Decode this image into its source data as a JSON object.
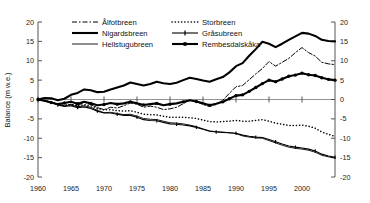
{
  "chart_data": {
    "type": "line",
    "title": "",
    "xlabel": "",
    "ylabel": "Balance (m w.e.)",
    "ylabel_right": "",
    "xlim": [
      1960,
      2005
    ],
    "ylim": [
      -20,
      20
    ],
    "yticks": [
      -20,
      -15,
      -10,
      -5,
      0,
      5,
      10,
      15,
      20
    ],
    "ytick_labels": [
      "-20",
      "-15",
      "-10",
      "-5",
      "0",
      "5",
      "10",
      "15",
      "20"
    ],
    "ytick_labels_right": [
      "-20",
      "-15",
      "-10",
      "-5",
      "0",
      "5",
      "10",
      "15",
      "20"
    ],
    "xticks": [
      1960,
      1965,
      1970,
      1975,
      1980,
      1985,
      1990,
      1995,
      2000
    ],
    "xtick_labels": [
      "1960",
      "1965",
      "1970",
      "1975",
      "1980",
      "1985",
      "1990",
      "1995",
      "2000"
    ],
    "grid": false,
    "legend_position": "top",
    "dual_y_axis": true,
    "x": [
      1960,
      1961,
      1962,
      1963,
      1964,
      1965,
      1966,
      1967,
      1968,
      1969,
      1970,
      1971,
      1972,
      1973,
      1974,
      1975,
      1976,
      1977,
      1978,
      1979,
      1980,
      1981,
      1982,
      1983,
      1984,
      1985,
      1986,
      1987,
      1988,
      1989,
      1990,
      1991,
      1992,
      1993,
      1994,
      1995,
      1996,
      1997,
      1998,
      1999,
      2000,
      2001,
      2002,
      2003,
      2004,
      2005
    ],
    "series": [
      {
        "name": "Ålfotbreen",
        "style": "dashed",
        "values": [
          0.0,
          -0.3,
          -0.7,
          -1.3,
          -1.6,
          -1.2,
          -1.6,
          -0.7,
          -1.3,
          -2.1,
          -2.6,
          -2.0,
          -2.2,
          -1.6,
          -0.9,
          -1.2,
          -2.0,
          -1.7,
          -2.0,
          -2.6,
          -2.4,
          -2.0,
          -1.1,
          -0.2,
          -0.5,
          -1.3,
          -1.8,
          -1.3,
          -0.2,
          1.6,
          3.3,
          3.6,
          5.1,
          6.6,
          8.0,
          9.8,
          8.6,
          9.6,
          10.6,
          12.1,
          13.4,
          12.1,
          11.2,
          9.6,
          9.2,
          9.0
        ]
      },
      {
        "name": "Nigardsbreen",
        "style": "thick-solid",
        "values": [
          0.0,
          0.4,
          0.3,
          -0.2,
          0.2,
          1.2,
          1.7,
          2.6,
          2.4,
          1.9,
          2.0,
          2.6,
          3.1,
          3.6,
          4.4,
          4.0,
          3.6,
          4.0,
          4.6,
          4.2,
          4.0,
          4.3,
          5.0,
          5.6,
          5.3,
          4.9,
          4.6,
          5.2,
          5.8,
          7.0,
          8.6,
          9.4,
          11.3,
          13.0,
          14.9,
          14.4,
          13.5,
          14.4,
          15.4,
          16.3,
          17.2,
          17.0,
          16.4,
          15.4,
          15.1,
          15.0
        ]
      },
      {
        "name": "Hellstugubreen",
        "style": "thin-solid",
        "values": [
          0.0,
          -0.3,
          -0.6,
          -1.2,
          -1.6,
          -1.4,
          -1.9,
          -1.6,
          -2.0,
          -2.8,
          -3.4,
          -3.3,
          -3.6,
          -3.9,
          -3.8,
          -4.3,
          -4.9,
          -5.1,
          -5.2,
          -5.6,
          -6.0,
          -6.1,
          -6.3,
          -6.6,
          -7.0,
          -7.6,
          -8.1,
          -8.3,
          -8.4,
          -8.6,
          -8.8,
          -9.4,
          -9.7,
          -9.9,
          -10.0,
          -10.6,
          -11.2,
          -11.8,
          -12.3,
          -12.6,
          -12.8,
          -13.1,
          -13.6,
          -14.4,
          -14.8,
          -15.1
        ]
      },
      {
        "name": "Storbreen",
        "style": "dotted",
        "values": [
          0.0,
          -0.3,
          -0.7,
          -1.3,
          -1.5,
          -1.3,
          -1.7,
          -1.3,
          -1.6,
          -2.3,
          -2.7,
          -2.6,
          -2.9,
          -3.0,
          -2.9,
          -3.3,
          -3.8,
          -3.9,
          -4.0,
          -4.3,
          -4.6,
          -4.6,
          -4.6,
          -4.7,
          -4.9,
          -5.3,
          -5.7,
          -5.8,
          -5.7,
          -5.6,
          -5.4,
          -5.6,
          -5.6,
          -5.4,
          -5.2,
          -5.6,
          -6.1,
          -6.4,
          -6.7,
          -6.7,
          -6.6,
          -6.9,
          -7.4,
          -8.4,
          -9.0,
          -9.5
        ]
      },
      {
        "name": "Gråsubreen",
        "style": "solid-tick",
        "values": [
          0.0,
          -0.4,
          -0.8,
          -1.4,
          -1.8,
          -1.6,
          -2.1,
          -1.9,
          -2.3,
          -3.0,
          -3.5,
          -3.5,
          -3.8,
          -4.1,
          -4.1,
          -4.6,
          -5.2,
          -5.4,
          -5.5,
          -5.9,
          -6.3,
          -6.4,
          -6.6,
          -6.8,
          -7.2,
          -7.7,
          -8.2,
          -8.4,
          -8.5,
          -8.6,
          -8.7,
          -9.2,
          -9.5,
          -9.7,
          -9.8,
          -10.3,
          -10.9,
          -11.5,
          -12.0,
          -12.3,
          -12.5,
          -12.8,
          -13.3,
          -14.1,
          -14.6,
          -14.9
        ]
      },
      {
        "name": "Rembesdalskåka",
        "style": "thick-marker",
        "values": [
          0.0,
          -0.3,
          -0.8,
          -1.2,
          -0.9,
          -0.6,
          -1.1,
          -0.6,
          -1.0,
          -1.5,
          -1.3,
          -0.9,
          -1.2,
          -1.0,
          -0.6,
          -1.0,
          -1.4,
          -1.2,
          -1.0,
          -1.5,
          -1.2,
          -1.0,
          -0.6,
          -0.2,
          -0.5,
          -1.0,
          -1.5,
          -1.1,
          -0.6,
          0.2,
          1.0,
          1.2,
          2.1,
          3.1,
          4.1,
          5.0,
          4.6,
          5.3,
          6.0,
          6.3,
          6.8,
          6.4,
          6.2,
          5.6,
          5.2,
          5.0
        ]
      }
    ]
  },
  "legend": {
    "entries": [
      {
        "label": "Ålfotbreen",
        "style": "dashed"
      },
      {
        "label": "Storbreen",
        "style": "dotted"
      },
      {
        "label": "Nigardsbreen",
        "style": "thick-solid"
      },
      {
        "label": "Gråsubreen",
        "style": "solid-tick"
      },
      {
        "label": "Hellstugubreen",
        "style": "thin-solid"
      },
      {
        "label": "Rembesdalskåka",
        "style": "thick-marker"
      }
    ]
  }
}
